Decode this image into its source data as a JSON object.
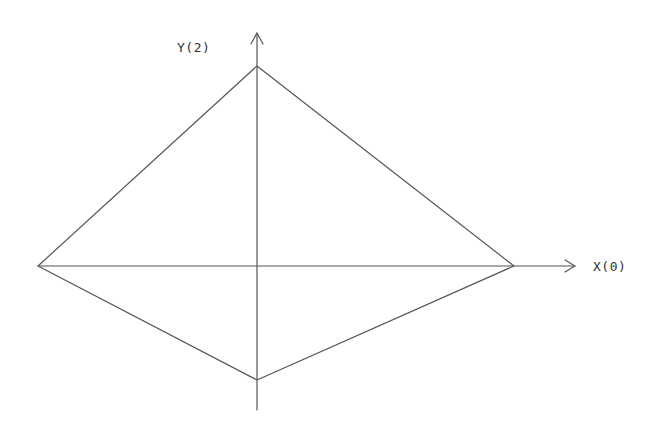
{
  "diagram": {
    "type": "quadrilateral-on-axes",
    "stroke_color": "#555555",
    "background": "#ffffff",
    "axes": {
      "x": {
        "label": "X(0)",
        "from": [
          38,
          266
        ],
        "to": [
          575,
          266
        ]
      },
      "y": {
        "label": "Y(2)",
        "from": [
          257,
          410
        ],
        "to": [
          257,
          33
        ]
      }
    },
    "vertices": {
      "top": [
        257,
        66
      ],
      "right": [
        514,
        266
      ],
      "bottom": [
        257,
        380
      ],
      "left": [
        38,
        266
      ]
    }
  }
}
